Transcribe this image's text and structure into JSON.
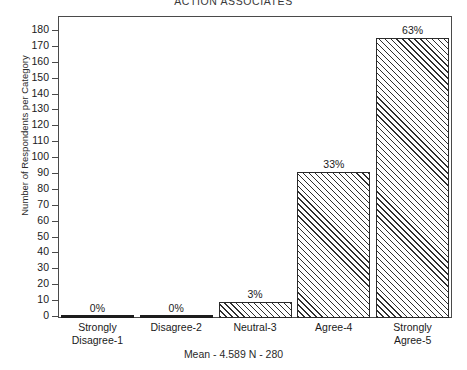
{
  "chart_data": {
    "type": "bar",
    "title": "ACTION ASSOCIATES",
    "xlabel": "",
    "ylabel": "Number of Respondents per Category",
    "ylim": [
      0,
      180
    ],
    "yticks": [
      0,
      10,
      20,
      30,
      40,
      50,
      60,
      70,
      80,
      90,
      100,
      110,
      120,
      130,
      140,
      150,
      160,
      170,
      180
    ],
    "grid": false,
    "legend": "none",
    "categories": [
      "Strongly Disagree-1",
      "Disagree-2",
      "Neutral-3",
      "Agree-4",
      "Strongly Agree-5"
    ],
    "category_lines": [
      [
        "Strongly",
        "Disagree-1"
      ],
      [
        "Disagree-2"
      ],
      [
        "Neutral-3"
      ],
      [
        "Agree-4"
      ],
      [
        "Strongly",
        "Agree-5"
      ]
    ],
    "values": [
      0,
      0,
      10,
      92,
      176
    ],
    "data_labels": [
      "0%",
      "0%",
      "3%",
      "33%",
      "63%"
    ],
    "percentages": [
      0,
      0,
      3,
      33,
      63
    ],
    "annotation": "Mean - 4.589  N - 280",
    "statistics": {
      "mean_label": "Mean - 4.589",
      "n_label": "N - 280",
      "mean": 4.589,
      "n": 280
    },
    "style": {
      "bar_fill": "hatch-diagonal",
      "bar_edge_color": "#2b2b2b",
      "background": "#ffffff",
      "frame_color": "#4a4a4a"
    }
  }
}
